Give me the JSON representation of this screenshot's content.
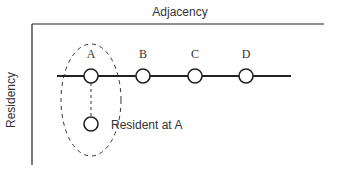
{
  "axes": {
    "top_label": "Adjacency",
    "left_label": "Residency"
  },
  "nodes": [
    {
      "label": "A",
      "cx": 91
    },
    {
      "label": "B",
      "cx": 143
    },
    {
      "label": "C",
      "cx": 195
    },
    {
      "label": "D",
      "cx": 246
    }
  ],
  "resident": {
    "label": "Resident at A"
  },
  "colors": {
    "stroke": "#222222",
    "text": "#333333"
  }
}
